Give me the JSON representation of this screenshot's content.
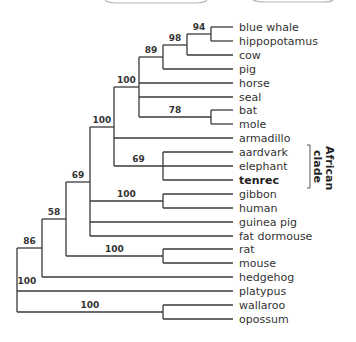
{
  "figure": {
    "type": "phylogenetic-tree",
    "leaves": [
      {
        "id": "blue_whale",
        "label": "blue whale",
        "bold": false
      },
      {
        "id": "hippopotamus",
        "label": "hippopotamus",
        "bold": false
      },
      {
        "id": "cow",
        "label": "cow",
        "bold": false
      },
      {
        "id": "pig",
        "label": "pig",
        "bold": false
      },
      {
        "id": "horse",
        "label": "horse",
        "bold": false
      },
      {
        "id": "seal",
        "label": "seal",
        "bold": false
      },
      {
        "id": "bat",
        "label": "bat",
        "bold": false
      },
      {
        "id": "mole",
        "label": "mole",
        "bold": false
      },
      {
        "id": "armadillo",
        "label": "armadillo",
        "bold": false
      },
      {
        "id": "aardvark",
        "label": "aardvark",
        "bold": false
      },
      {
        "id": "elephant",
        "label": "elephant",
        "bold": false
      },
      {
        "id": "tenrec",
        "label": "tenrec",
        "bold": true
      },
      {
        "id": "gibbon",
        "label": "gibbon",
        "bold": false
      },
      {
        "id": "human",
        "label": "human",
        "bold": false
      },
      {
        "id": "guinea_pig",
        "label": "guinea pig",
        "bold": false
      },
      {
        "id": "fat_dormouse",
        "label": "fat dormouse",
        "bold": false
      },
      {
        "id": "rat",
        "label": "rat",
        "bold": false
      },
      {
        "id": "mouse",
        "label": "mouse",
        "bold": false
      },
      {
        "id": "hedgehog",
        "label": "hedgehog",
        "bold": false
      },
      {
        "id": "platypus",
        "label": "platypus",
        "bold": false
      },
      {
        "id": "wallaroo",
        "label": "wallaroo",
        "bold": false
      },
      {
        "id": "opossum",
        "label": "opossum",
        "bold": false
      }
    ],
    "nodes": [
      {
        "id": "n_root",
        "support": "100",
        "x": 17,
        "children": [
          "n_86",
          "platypus",
          "n_marsupial"
        ]
      },
      {
        "id": "n_86",
        "support": "86",
        "x": 42,
        "children": [
          "n_58",
          "hedgehog"
        ]
      },
      {
        "id": "n_58",
        "support": "58",
        "x": 66,
        "children": [
          "n_69a",
          "n_rodent"
        ]
      },
      {
        "id": "n_69a",
        "support": "69",
        "x": 90,
        "children": [
          "n_100a",
          "n_primate",
          "guinea_pig",
          "fat_dormouse"
        ]
      },
      {
        "id": "n_100a",
        "support": "100",
        "x": 114,
        "children": [
          "n_laur",
          "armadillo",
          "n_african"
        ]
      },
      {
        "id": "n_laur",
        "support": "100",
        "x": 139,
        "children": [
          "n_89",
          "horse",
          "seal",
          "n_78"
        ]
      },
      {
        "id": "n_89",
        "support": "89",
        "x": 163,
        "children": [
          "n_98",
          "pig"
        ]
      },
      {
        "id": "n_98",
        "support": "98",
        "x": 187,
        "children": [
          "n_94",
          "cow"
        ]
      },
      {
        "id": "n_94",
        "support": "94",
        "x": 211,
        "children": [
          "blue_whale",
          "hippopotamus"
        ]
      },
      {
        "id": "n_78",
        "support": "78",
        "x": 211,
        "children": [
          "bat",
          "mole"
        ]
      },
      {
        "id": "n_african",
        "support": "69",
        "x": 163,
        "children": [
          "aardvark",
          "elephant",
          "tenrec"
        ]
      },
      {
        "id": "n_primate",
        "support": "100",
        "x": 163,
        "children": [
          "gibbon",
          "human"
        ]
      },
      {
        "id": "n_rodent",
        "support": "100",
        "x": 163,
        "children": [
          "rat",
          "mouse"
        ]
      },
      {
        "id": "n_marsupial",
        "support": "100",
        "x": 163,
        "children": [
          "wallaroo",
          "opossum"
        ]
      }
    ],
    "layout": {
      "leaf_x_end": 233,
      "label_x": 239,
      "first_row_y": 27,
      "row_spacing": 13.9
    },
    "clade_annotation": {
      "lines": [
        "African",
        "clade"
      ],
      "from_leaf": "aardvark",
      "to_leaf": "tenrec"
    }
  }
}
